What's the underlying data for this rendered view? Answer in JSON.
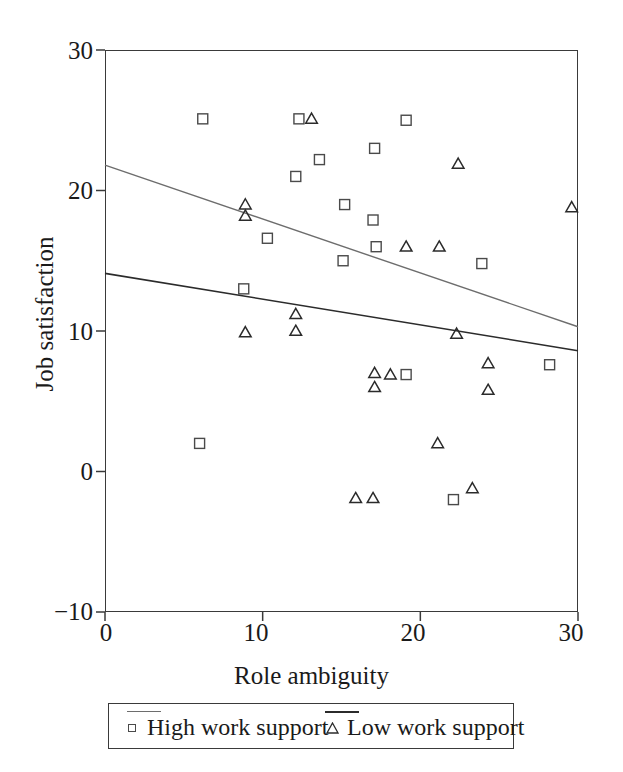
{
  "chart_data": {
    "type": "scatter",
    "title": "",
    "xlabel": "Role ambiguity",
    "ylabel": "Job satisfaction",
    "xlim": [
      0,
      30
    ],
    "ylim": [
      -10,
      30
    ],
    "xticks": [
      "0",
      "10",
      "20",
      "30"
    ],
    "xtick_values": [
      0,
      10,
      20,
      30
    ],
    "yticks": [
      "30",
      "20",
      "10",
      "0",
      "-10"
    ],
    "ytick_values": [
      30,
      20,
      10,
      0,
      -10
    ],
    "grid": false,
    "legend_position": "below-axis",
    "series": [
      {
        "name": "High work support",
        "marker": "square",
        "marker_color": "#4a4a4a",
        "line_color": "#6d6d6d",
        "line_width": 1.4,
        "trendline": {
          "x0": 0,
          "y0": 21.8,
          "x1": 30,
          "y1": 10.3
        },
        "points": [
          [
            6.2,
            25.1
          ],
          [
            6.0,
            2.0
          ],
          [
            8.8,
            13.0
          ],
          [
            10.3,
            16.6
          ],
          [
            12.1,
            21.0
          ],
          [
            12.3,
            25.1
          ],
          [
            13.6,
            22.2
          ],
          [
            15.2,
            19.0
          ],
          [
            15.1,
            15.0
          ],
          [
            17.1,
            23.0
          ],
          [
            17.0,
            17.9
          ],
          [
            17.2,
            16.0
          ],
          [
            19.1,
            25.0
          ],
          [
            19.1,
            6.9
          ],
          [
            22.1,
            -2.0
          ],
          [
            23.9,
            14.8
          ],
          [
            28.2,
            7.6
          ]
        ]
      },
      {
        "name": "Low work support",
        "marker": "triangle",
        "marker_color": "#2b2b2b",
        "line_color": "#2b2b2b",
        "line_width": 1.6,
        "trendline": {
          "x0": 0,
          "y0": 14.1,
          "x1": 30,
          "y1": 8.6
        },
        "points": [
          [
            8.9,
            19.0
          ],
          [
            8.9,
            18.2
          ],
          [
            8.9,
            9.9
          ],
          [
            12.1,
            11.2
          ],
          [
            12.1,
            10.0
          ],
          [
            13.1,
            25.1
          ],
          [
            15.9,
            -1.9
          ],
          [
            17.0,
            -1.9
          ],
          [
            17.1,
            7.0
          ],
          [
            17.1,
            6.0
          ],
          [
            18.1,
            6.9
          ],
          [
            19.1,
            16.0
          ],
          [
            21.1,
            2.0
          ],
          [
            21.2,
            16.0
          ],
          [
            22.3,
            9.8
          ],
          [
            22.4,
            21.9
          ],
          [
            23.3,
            -1.2
          ],
          [
            24.3,
            7.7
          ],
          [
            24.3,
            5.8
          ],
          [
            29.6,
            18.8
          ]
        ]
      }
    ]
  },
  "legend": {
    "entries": [
      {
        "label": "High work support",
        "marker": "square-marker"
      },
      {
        "label": "Low work support",
        "marker": "triangle-marker"
      }
    ]
  },
  "axes": {
    "x_title": "Role ambiguity",
    "y_title": "Job satisfaction",
    "x_tick_labels": [
      "0",
      "10",
      "20",
      "30"
    ],
    "y_tick_labels": [
      "30",
      "20",
      "10",
      "0",
      "−10"
    ]
  }
}
